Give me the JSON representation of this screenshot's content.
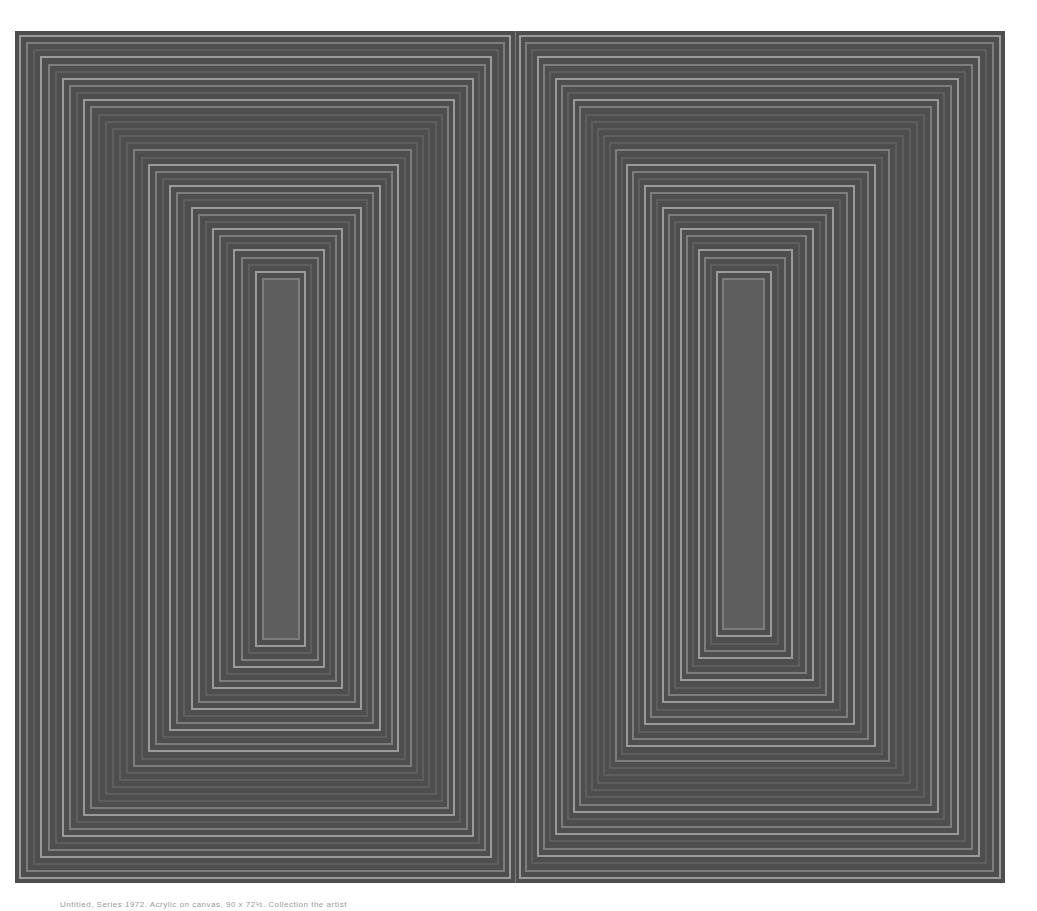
{
  "artwork": {
    "description": "Grayscale reproduction of a hard-edge op-art painting: two side-by-side panels of nested concentric rectangular stripes converging to narrow vertical centers",
    "colors": {
      "background": "#ffffff",
      "frame_dark": "#4e4e4e",
      "band_light": "#9a9a9a",
      "band_mid": "#7d7d7d",
      "band_dark": "#5e5e5e"
    },
    "panels": [
      {
        "name": "left-panel",
        "x": 0,
        "width": 500,
        "inner": {
          "left": 247,
          "top": 247,
          "right": 285,
          "bottom": 609
        }
      },
      {
        "name": "right-panel",
        "x": 500,
        "width": 490,
        "inner": {
          "left": 207,
          "top": 247,
          "right": 250,
          "bottom": 599
        }
      }
    ]
  },
  "caption": {
    "text": "Untitled, Series 1972. Acrylic on canvas, 90 x 72½. Collection the artist"
  }
}
